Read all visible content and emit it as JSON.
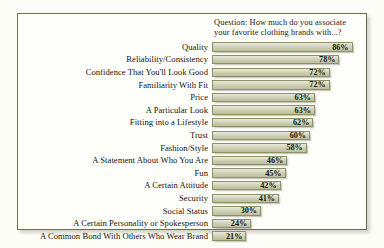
{
  "question": {
    "line1": "Question: How much do you associate",
    "line2": "your favorite clothing brands with...?"
  },
  "colors": {
    "frame_border": "#6b6f4d",
    "bar_fill_light": "#e9eadb",
    "bar_fill_dark": "#bcc0a0",
    "bar_border": "#8d9168",
    "text": "#15150f",
    "background": "#fefefa"
  },
  "chart_data": {
    "type": "bar",
    "orientation": "horizontal",
    "title": "Question: How much do you associate your favorite clothing brands with...?",
    "xlabel": "",
    "ylabel": "",
    "xlim": [
      0,
      100
    ],
    "grid": false,
    "legend": false,
    "value_suffix": "%",
    "categories": [
      "Quality",
      "Reliability/Consistency",
      "Confidence That You'll Look Good",
      "Familiarity With Fit",
      "Price",
      "A Particular Look",
      "Fitting into a Lifestyle",
      "Trust",
      "Fashion/Style",
      "A Statement About Who You Are",
      "Fun",
      "A Certain Attitude",
      "Security",
      "Social Status",
      "A Certain Personality or Spokesperson",
      "A Common Bond With Others Who Wear Brand"
    ],
    "values": [
      86,
      78,
      72,
      72,
      63,
      63,
      62,
      60,
      58,
      46,
      45,
      42,
      41,
      30,
      24,
      21
    ],
    "value_labels": [
      "86%",
      "78%",
      "72%",
      "72%",
      "63%",
      "63%",
      "62%",
      "60%",
      "58%",
      "46%",
      "45%",
      "42%",
      "41%",
      "30%",
      "24%",
      "21%"
    ]
  }
}
